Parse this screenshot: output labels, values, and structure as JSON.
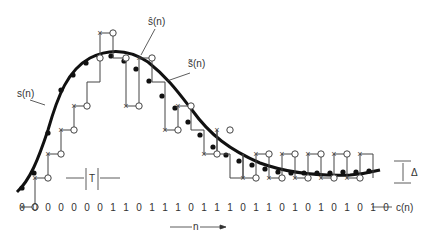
{
  "labels": {
    "signal": "s(n)",
    "estimate_hat": "ŝ(n)",
    "estimate_tilde": "s̃(n)",
    "period": "T",
    "step": "Δ",
    "code": "c(n)",
    "time_axis": "n"
  },
  "code_bits": [
    "0",
    "0",
    "0",
    "0",
    "0",
    "0",
    "0",
    "1",
    "1",
    "0",
    "1",
    "1",
    "1",
    "0",
    "1",
    "1",
    "1",
    "0",
    "1",
    "1",
    "0",
    "1",
    "0",
    "1",
    "0",
    "1",
    "0",
    "1",
    "0"
  ],
  "colors": {
    "curve": "#111111",
    "staircase": "#444444",
    "text": "#333333"
  }
}
